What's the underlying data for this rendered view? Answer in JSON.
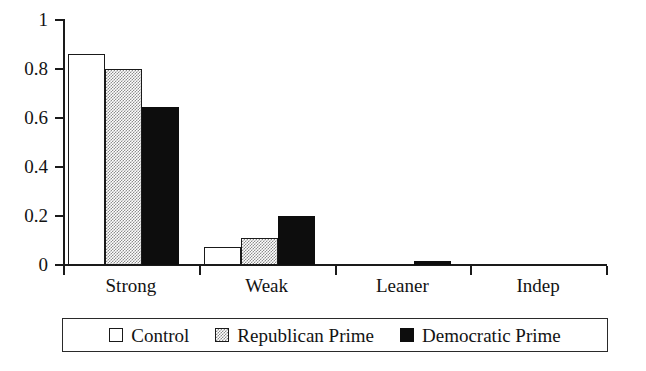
{
  "chart_data": {
    "type": "bar",
    "title": "",
    "subtitle": "",
    "xlabel": "",
    "ylabel": "",
    "categories": [
      "Strong",
      "Weak",
      "Leaner",
      "Indep"
    ],
    "series": [
      {
        "name": "Control",
        "color": "#ffffff",
        "fill": "white",
        "values": [
          0.86,
          0.075,
          0,
          0
        ]
      },
      {
        "name": "Republican Prime",
        "color": "#8d8d8d",
        "fill": "gray-dither",
        "values": [
          0.8,
          0.11,
          0,
          0
        ]
      },
      {
        "name": "Democratic Prime",
        "color": "#0d0d0d",
        "fill": "black",
        "values": [
          0.645,
          0.2,
          0.015,
          0
        ]
      }
    ],
    "ylim": [
      0,
      1
    ],
    "yticks": [
      0,
      0.2,
      0.4,
      0.6,
      0.8,
      1
    ],
    "ytick_labels": [
      "0",
      "0.2",
      "0.4",
      "0.6",
      "0.8",
      "1"
    ],
    "grid": false,
    "legend_position": "bottom",
    "legend_entries": [
      "Control",
      "Republican Prime",
      "Democratic Prime"
    ]
  }
}
